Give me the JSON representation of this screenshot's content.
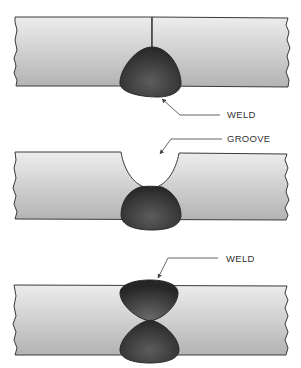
{
  "diagram": {
    "type": "weld-joint-illustrations",
    "colors": {
      "plate_top": "#ececec",
      "plate_bottom": "#b4b4b4",
      "weld_light": "#5a5a5a",
      "weld_dark": "#2a2a2a",
      "outline": "#3a3a3a",
      "text": "#333333"
    },
    "panels": [
      {
        "name": "square-butt-weld",
        "labels": [
          {
            "text": "WELD"
          }
        ]
      },
      {
        "name": "groove-weld",
        "labels": [
          {
            "text": "GROOVE"
          }
        ]
      },
      {
        "name": "double-sided-weld",
        "labels": [
          {
            "text": "WELD"
          }
        ]
      }
    ]
  }
}
